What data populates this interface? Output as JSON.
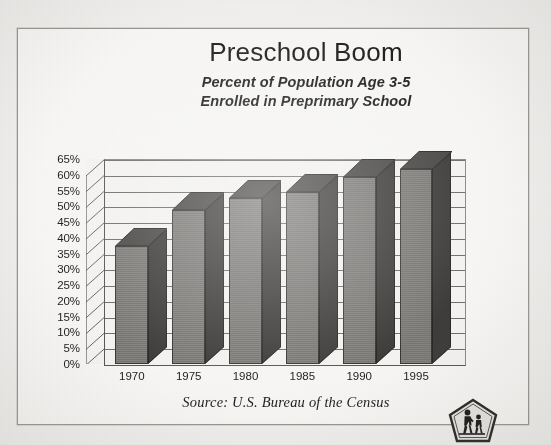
{
  "figure": {
    "title": "Preschool Boom",
    "subtitle_line1": "Percent of Population Age 3-5",
    "subtitle_line2": "Enrolled in Preprimary School",
    "source": "Source: U.S. Bureau of the Census",
    "logo_name": "school-crossing-sign"
  },
  "chart_data": {
    "type": "bar",
    "title": "Preschool Boom",
    "subtitle": "Percent of Population Age 3-5 Enrolled in Preprimary School",
    "xlabel": "",
    "ylabel": "",
    "categories": [
      "1970",
      "1975",
      "1980",
      "1985",
      "1990",
      "1995"
    ],
    "values": [
      37.5,
      48.7,
      52.5,
      54.6,
      59.4,
      61.8
    ],
    "value_labels": [
      "37.5%",
      "48.7%",
      "52.5%",
      "54.6%",
      "59.4%",
      "61.8%"
    ],
    "ylim": [
      0,
      65
    ],
    "ytick_step": 5,
    "ytick_labels": [
      "0%",
      "5%",
      "10%",
      "15%",
      "20%",
      "25%",
      "30%",
      "35%",
      "40%",
      "45%",
      "50%",
      "55%",
      "60%",
      "65%"
    ],
    "ytick_values": [
      0,
      5,
      10,
      15,
      20,
      25,
      30,
      35,
      40,
      45,
      50,
      55,
      60,
      65
    ],
    "grid": true,
    "legend": "none",
    "style": "3d-column",
    "series": [
      {
        "name": "Percent enrolled in preprimary school",
        "values": [
          37.5,
          48.7,
          52.5,
          54.6,
          59.4,
          61.8
        ]
      }
    ],
    "annotations": [
      "Source: U.S. Bureau of the Census"
    ],
    "colors": {
      "bar_front": "#7e7c79",
      "bar_side": "#3f3d3b",
      "bar_top": "#4a4846",
      "plot_background": "#f7f6f4",
      "gridline": "#5a5855",
      "text": "#1d1d1d",
      "card_background": "#faf9f7",
      "page_background": "#f3f2f0"
    }
  }
}
